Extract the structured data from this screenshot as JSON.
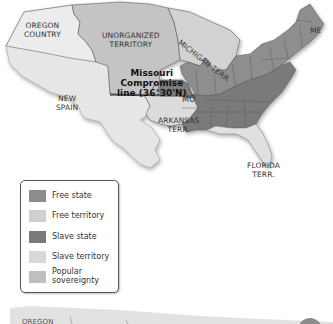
{
  "map": {
    "labels": {
      "oregon": [
        "OREGON",
        "COUNTRY"
      ],
      "unorganized": [
        "UNORGANIZED",
        "TERRITORY"
      ],
      "michigan": "MICHIGAN TERR.",
      "maine": "ME",
      "missouri_line": [
        "Missouri",
        "Compromise",
        "line (36°30'N)"
      ],
      "new_spain": [
        "NEW",
        "SPAIN"
      ],
      "missouri": "MO",
      "arkansas": [
        "ARKANSAS",
        "TERR."
      ],
      "florida": [
        "FLORIDA",
        "TERR."
      ]
    },
    "colors": {
      "free_state": "#8c8c8c",
      "free_territory": "#c9c9c9",
      "slave_state": "#7d7d7d",
      "slave_territory": "#d6d6d6",
      "popular_sovereignty": "#bdbdbd",
      "foreign": "#e4e4e4",
      "border": "#5a5a5a"
    }
  },
  "legend": {
    "items": [
      {
        "label": "Free state",
        "color": "#8c8c8c"
      },
      {
        "label": "Free territory",
        "color": "#cfcfcf"
      },
      {
        "label": "Slave state",
        "color": "#7a7a7a"
      },
      {
        "label": "Slave territory",
        "color": "#d8d8d8"
      },
      {
        "label": "Popular sovereignty",
        "line1": "Popular",
        "line2": "sovereignty",
        "color": "#bfbfbf"
      }
    ]
  },
  "second_map": {
    "labels": {
      "oregon_partial": "OREGON"
    }
  }
}
